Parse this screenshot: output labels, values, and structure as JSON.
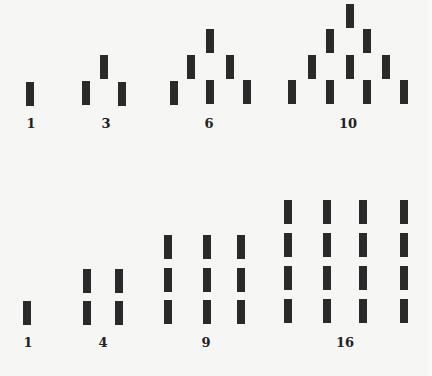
{
  "figure": {
    "bar_color": "#2a2a2a",
    "background": "#f6f6f4"
  },
  "triangular": {
    "row_label": "Triangular numbers",
    "groups": [
      {
        "label": "1",
        "bars": [
          [
            26,
            82
          ]
        ]
      },
      {
        "label": "3",
        "bars": [
          [
            82,
            81
          ],
          [
            100,
            55
          ],
          [
            118,
            82
          ]
        ]
      },
      {
        "label": "6",
        "bars": [
          [
            170,
            81
          ],
          [
            187,
            55
          ],
          [
            206,
            29
          ],
          [
            226,
            55
          ],
          [
            206,
            80
          ],
          [
            243,
            80
          ]
        ]
      },
      {
        "label": "10",
        "bars": [
          [
            346,
            4
          ],
          [
            326,
            29
          ],
          [
            363,
            29
          ],
          [
            308,
            55
          ],
          [
            346,
            55
          ],
          [
            382,
            55
          ],
          [
            288,
            80
          ],
          [
            326,
            80
          ],
          [
            363,
            80
          ],
          [
            400,
            80
          ]
        ]
      }
    ],
    "label_positions": [
      [
        31,
        117
      ],
      [
        106,
        117
      ],
      [
        209,
        117
      ],
      [
        348,
        117
      ]
    ]
  },
  "square": {
    "row_label": "Square numbers",
    "groups": [
      {
        "label": "1",
        "bars": [
          [
            23,
            301
          ]
        ]
      },
      {
        "label": "4",
        "bars": [
          [
            83,
            269
          ],
          [
            115,
            269
          ],
          [
            83,
            301
          ],
          [
            115,
            301
          ]
        ]
      },
      {
        "label": "9",
        "bars": [
          [
            164,
            235
          ],
          [
            203,
            235
          ],
          [
            237,
            235
          ],
          [
            164,
            268
          ],
          [
            203,
            268
          ],
          [
            237,
            268
          ],
          [
            164,
            300
          ],
          [
            203,
            300
          ],
          [
            237,
            300
          ]
        ]
      },
      {
        "label": "16",
        "bars": [
          [
            284,
            200
          ],
          [
            323,
            200
          ],
          [
            359,
            200
          ],
          [
            400,
            200
          ],
          [
            284,
            233
          ],
          [
            323,
            233
          ],
          [
            359,
            233
          ],
          [
            400,
            233
          ],
          [
            284,
            266
          ],
          [
            323,
            266
          ],
          [
            359,
            266
          ],
          [
            400,
            266
          ],
          [
            284,
            299
          ],
          [
            323,
            299
          ],
          [
            359,
            299
          ],
          [
            400,
            299
          ]
        ]
      }
    ],
    "label_positions": [
      [
        28,
        336
      ],
      [
        103,
        336
      ],
      [
        206,
        336
      ],
      [
        345,
        336
      ]
    ]
  }
}
